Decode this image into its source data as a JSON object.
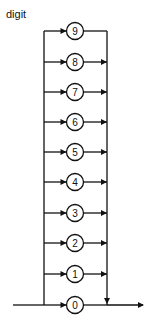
{
  "diagram": {
    "title": "digit",
    "type": "syntax-diagram",
    "nodes": [
      {
        "label": "9",
        "y": 31
      },
      {
        "label": "8",
        "y": 62
      },
      {
        "label": "7",
        "y": 92
      },
      {
        "label": "6",
        "y": 122
      },
      {
        "label": "5",
        "y": 152
      },
      {
        "label": "4",
        "y": 182
      },
      {
        "label": "3",
        "y": 213
      },
      {
        "label": "2",
        "y": 243
      },
      {
        "label": "1",
        "y": 274
      },
      {
        "label": "0",
        "y": 305
      }
    ],
    "colors": {
      "stroke": "#111111",
      "background": "#ffffff"
    }
  }
}
